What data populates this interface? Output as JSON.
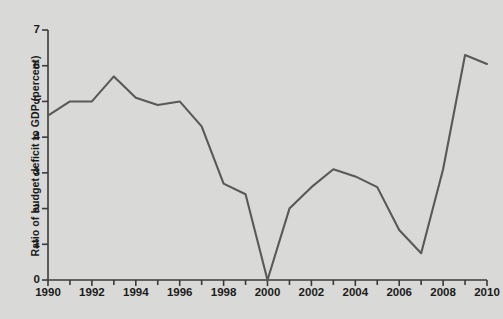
{
  "chart_data": {
    "type": "line",
    "title": "",
    "xlabel": "",
    "ylabel": "Ratio of budget deficit to GDP (percent)",
    "x": [
      1990,
      1991,
      1992,
      1993,
      1994,
      1995,
      1996,
      1997,
      1998,
      1999,
      2000,
      2001,
      2002,
      2003,
      2004,
      2005,
      2006,
      2007,
      2008,
      2009,
      2010
    ],
    "values": [
      4.6,
      5.0,
      5.0,
      5.7,
      5.1,
      4.9,
      5.0,
      4.3,
      2.7,
      2.4,
      0.0,
      2.0,
      2.6,
      3.1,
      2.9,
      2.6,
      1.4,
      0.75,
      3.1,
      6.3,
      6.05
    ],
    "series": [
      {
        "name": "Ratio of budget deficit to GDP",
        "values": [
          4.6,
          5.0,
          5.0,
          5.7,
          5.1,
          4.9,
          5.0,
          4.3,
          2.7,
          2.4,
          0.0,
          2.0,
          2.6,
          3.1,
          2.9,
          2.6,
          1.4,
          0.75,
          3.1,
          6.3,
          6.05
        ]
      }
    ],
    "xlim": [
      1990,
      2010
    ],
    "ylim": [
      0,
      7
    ],
    "ytick_labels": [
      "0",
      "1",
      "2",
      "3",
      "4",
      "5",
      "6",
      "7"
    ],
    "ytick_values": [
      0,
      1,
      2,
      3,
      4,
      5,
      6,
      7
    ],
    "xtick_labels": [
      "1990",
      "1992",
      "1994",
      "1996",
      "1998",
      "2000",
      "2002",
      "2004",
      "2006",
      "2008",
      "2010"
    ],
    "xtick_values": [
      1990,
      1992,
      1994,
      1996,
      1998,
      2000,
      2002,
      2004,
      2006,
      2008,
      2010
    ],
    "xminor_step": 1,
    "grid": false,
    "legend": "none",
    "colors": {
      "background": "#d9d9d7",
      "line": "#595959",
      "axis": "#3a3a3a",
      "text": "#1b1b1b"
    },
    "line_width": 2.1
  }
}
